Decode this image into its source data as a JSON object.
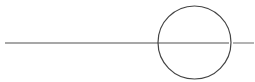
{
  "diagram": {
    "width": 255,
    "height": 82,
    "background": "#ffffff",
    "line": {
      "segments": [
        {
          "x1": 5,
          "y1": 43,
          "x2": 229,
          "y2": 43
        },
        {
          "x1": 233,
          "y1": 43,
          "x2": 254,
          "y2": 43
        }
      ],
      "color": "#8a8a8a",
      "width": 1.3
    },
    "circle": {
      "cx": 194.5,
      "cy": 42.5,
      "r": 36.5,
      "stroke": "#444444",
      "stroke_width": 1.2,
      "fill": "none"
    }
  }
}
